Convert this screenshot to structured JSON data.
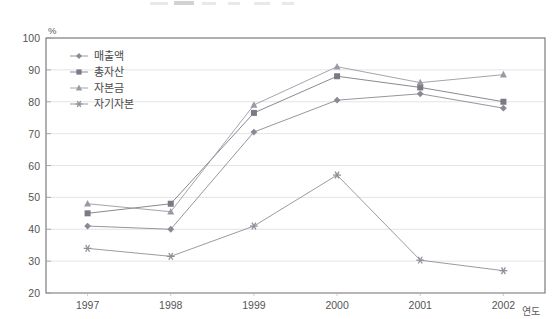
{
  "chart_data": {
    "type": "line",
    "title": "",
    "xlabel": "연도",
    "ylabel": "%",
    "unit_label": "%",
    "categories": [
      "1997",
      "1998",
      "1999",
      "2000",
      "2001",
      "2002"
    ],
    "x": [
      1997,
      1998,
      1999,
      2000,
      2001,
      2002
    ],
    "ylim": [
      20,
      100
    ],
    "yticks": [
      20,
      30,
      40,
      50,
      60,
      70,
      80,
      90,
      100
    ],
    "grid": true,
    "legend_position": "top-left-inside",
    "series": [
      {
        "name": "매출액",
        "marker": "diamond",
        "color": "#8a8a95",
        "values": [
          41,
          40,
          70.5,
          80.5,
          82.5,
          78
        ]
      },
      {
        "name": "총자산",
        "marker": "square",
        "color": "#7a7a86",
        "values": [
          45,
          48,
          76.5,
          88,
          84.5,
          80
        ]
      },
      {
        "name": "자본금",
        "marker": "triangle",
        "color": "#9a9aa4",
        "values": [
          48,
          45.5,
          79,
          91,
          86,
          88.5
        ]
      },
      {
        "name": "자기자본",
        "marker": "star",
        "color": "#8f8f99",
        "values": [
          34,
          31.5,
          41,
          57,
          30.3,
          27
        ]
      }
    ]
  },
  "axis": {
    "y_unit": "%",
    "x_title": "연도",
    "y_tick_labels": [
      "100",
      "90",
      "80",
      "70",
      "60",
      "50",
      "40",
      "30",
      "20"
    ],
    "x_tick_labels": [
      "1997",
      "1998",
      "1999",
      "2000",
      "2001",
      "2002"
    ]
  },
  "legend": {
    "items": [
      {
        "label": "매출액",
        "marker": "diamond-marker"
      },
      {
        "label": "총자산",
        "marker": "square-marker"
      },
      {
        "label": "자본금",
        "marker": "triangle-marker"
      },
      {
        "label": "자기자본",
        "marker": "star-marker"
      }
    ]
  }
}
